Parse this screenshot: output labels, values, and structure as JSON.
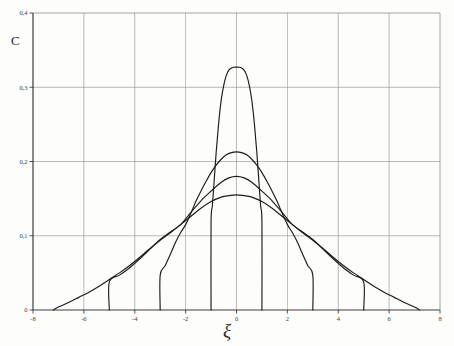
{
  "figure": {
    "background_color": "#fdfdfc",
    "ink_color": "#2b2b2b",
    "grid_color": "#8c8c8c",
    "axis_color": "#3c3c3c",
    "curve_color": "#1c1c1c"
  },
  "axes": {
    "y_axis_name": "C",
    "x_axis_name": "ξ",
    "y_tick_labels": [
      "0,4",
      "0,3",
      "0,2",
      "0,1",
      "0"
    ],
    "x_tick_labels": [
      "-8",
      "-6",
      "-4",
      "-2",
      "0",
      "2",
      "4",
      "6",
      "8"
    ]
  },
  "chart_data": {
    "type": "line",
    "title": "",
    "subtitle": "",
    "xlabel": "ξ",
    "ylabel": "C",
    "xlim": [
      -8,
      8
    ],
    "ylim": [
      0,
      0.4
    ],
    "xticks": [
      -8,
      -6,
      -4,
      -2,
      0,
      2,
      4,
      6,
      8
    ],
    "yticks": [
      0,
      0.1,
      0.2,
      0.3,
      0.4
    ],
    "xtick_labels": [
      "-8",
      "-6",
      "-4",
      "-2",
      "0",
      "2",
      "4",
      "6",
      "8"
    ],
    "ytick_labels": [
      "0",
      "0,1",
      "0,2",
      "0,3",
      "0,4"
    ],
    "grid": true,
    "grid_axes": "both",
    "legend": false,
    "legend_position": "none",
    "annotations": [],
    "series": [
      {
        "name": "curve-1-narrow",
        "peak_value": 0.327,
        "cutoff": 1.0,
        "x": [
          -1.0,
          -1.0,
          -0.95,
          -0.9,
          -0.8,
          -0.7,
          -0.6,
          -0.5,
          -0.4,
          -0.3,
          -0.2,
          -0.1,
          0.0,
          0.1,
          0.2,
          0.3,
          0.4,
          0.5,
          0.6,
          0.7,
          0.8,
          0.9,
          0.95,
          1.0,
          1.0
        ],
        "y": [
          0.0,
          0.118,
          0.14,
          0.163,
          0.212,
          0.252,
          0.283,
          0.303,
          0.316,
          0.323,
          0.326,
          0.327,
          0.327,
          0.327,
          0.326,
          0.323,
          0.316,
          0.303,
          0.283,
          0.252,
          0.212,
          0.163,
          0.14,
          0.118,
          0.0
        ]
      },
      {
        "name": "curve-2",
        "peak_value": 0.213,
        "cutoff": 3.0,
        "x": [
          -3.0,
          -3.0,
          -2.8,
          -2.6,
          -2.4,
          -2.2,
          -2.0,
          -1.8,
          -1.6,
          -1.4,
          -1.2,
          -1.0,
          -0.8,
          -0.6,
          -0.4,
          -0.2,
          0.0,
          0.2,
          0.4,
          0.6,
          0.8,
          1.0,
          1.2,
          1.4,
          1.6,
          1.8,
          2.0,
          2.2,
          2.4,
          2.6,
          2.8,
          3.0,
          3.0
        ],
        "y": [
          0.0,
          0.047,
          0.06,
          0.075,
          0.091,
          0.104,
          0.115,
          0.13,
          0.146,
          0.16,
          0.173,
          0.185,
          0.195,
          0.203,
          0.209,
          0.212,
          0.213,
          0.212,
          0.209,
          0.203,
          0.195,
          0.185,
          0.173,
          0.16,
          0.146,
          0.13,
          0.115,
          0.104,
          0.091,
          0.075,
          0.06,
          0.047,
          0.0
        ]
      },
      {
        "name": "curve-3",
        "peak_value": 0.18,
        "cutoff": 5.0,
        "x": [
          -5.0,
          -5.0,
          -4.6,
          -4.2,
          -3.8,
          -3.4,
          -3.0,
          -2.6,
          -2.2,
          -1.8,
          -1.4,
          -1.0,
          -0.6,
          -0.3,
          0.0,
          0.3,
          0.6,
          1.0,
          1.4,
          1.8,
          2.2,
          2.6,
          3.0,
          3.4,
          3.8,
          4.2,
          4.6,
          5.0,
          5.0
        ],
        "y": [
          0.0,
          0.038,
          0.047,
          0.057,
          0.069,
          0.082,
          0.095,
          0.105,
          0.115,
          0.131,
          0.147,
          0.16,
          0.172,
          0.178,
          0.18,
          0.178,
          0.172,
          0.16,
          0.147,
          0.131,
          0.115,
          0.105,
          0.095,
          0.082,
          0.069,
          0.057,
          0.047,
          0.038,
          0.0
        ]
      },
      {
        "name": "curve-4-wide",
        "peak_value": 0.155,
        "cutoff": 7.2,
        "x": [
          -7.2,
          -7.0,
          -6.6,
          -6.2,
          -5.8,
          -5.4,
          -5.0,
          -4.6,
          -4.2,
          -3.8,
          -3.4,
          -3.0,
          -2.6,
          -2.2,
          -1.8,
          -1.4,
          -1.0,
          -0.6,
          -0.3,
          0.0,
          0.3,
          0.6,
          1.0,
          1.4,
          1.8,
          2.2,
          2.6,
          3.0,
          3.4,
          3.8,
          4.2,
          4.6,
          5.0,
          5.4,
          5.8,
          6.2,
          6.6,
          7.0,
          7.2
        ],
        "y": [
          0.0,
          0.004,
          0.01,
          0.017,
          0.024,
          0.032,
          0.041,
          0.05,
          0.06,
          0.071,
          0.083,
          0.094,
          0.104,
          0.115,
          0.126,
          0.137,
          0.146,
          0.152,
          0.154,
          0.155,
          0.154,
          0.152,
          0.146,
          0.137,
          0.126,
          0.115,
          0.104,
          0.094,
          0.083,
          0.071,
          0.06,
          0.05,
          0.041,
          0.032,
          0.024,
          0.017,
          0.01,
          0.004,
          0.0
        ]
      }
    ]
  }
}
